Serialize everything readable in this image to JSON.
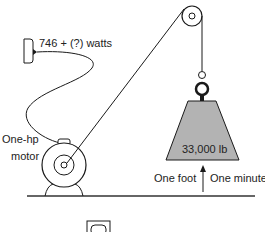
{
  "diagram": {
    "power_label": "746 + (?) watts",
    "motor_label_line1": "One-hp",
    "motor_label_line2": "motor",
    "weight_label": "33,000 lb",
    "distance_label": "One foot",
    "time_label": "One minute"
  },
  "colors": {
    "line": "#1a1a1a",
    "weight_fill": "#b3b3b3",
    "background": "#ffffff"
  }
}
